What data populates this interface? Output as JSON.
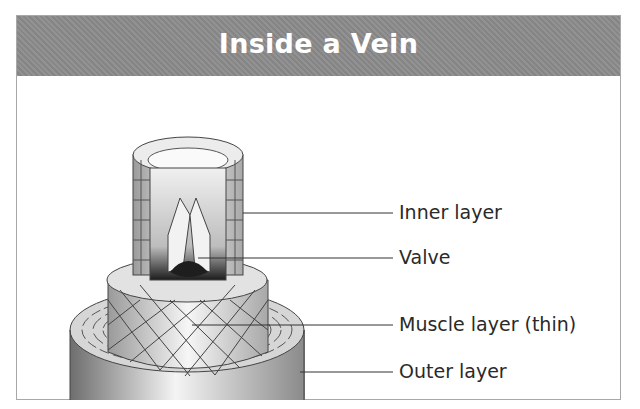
{
  "title": "Inside a Vein",
  "colors": {
    "header_bg": "#8c8c8c",
    "title_text": "#ffffff",
    "label_text": "#2a2a2a",
    "border": "#a8a8a8"
  },
  "labels": [
    {
      "text": "Inner layer",
      "y": 213
    },
    {
      "text": "Valve",
      "y": 258
    },
    {
      "text": "Muscle layer (thin)",
      "y": 325
    },
    {
      "text": "Outer layer",
      "y": 372
    }
  ]
}
